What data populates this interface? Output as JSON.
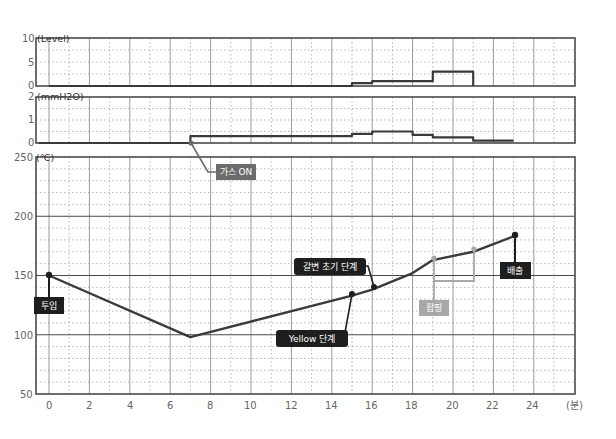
{
  "chart_data": [
    {
      "id": "level",
      "type": "line",
      "step": true,
      "title": "",
      "ylabel": "(Level)",
      "ylim": [
        0,
        10
      ],
      "yticks": [
        0,
        5,
        10
      ],
      "x": [
        0,
        15,
        15,
        16,
        16,
        19,
        19,
        21,
        21
      ],
      "values": [
        0,
        0,
        0.6,
        0.6,
        1.0,
        1.0,
        3.0,
        3.0,
        0
      ],
      "grid": true
    },
    {
      "id": "pressure",
      "type": "line",
      "step": true,
      "ylabel": "(mmH2O)",
      "ylim": [
        0,
        2
      ],
      "yticks": [
        0,
        1,
        2
      ],
      "x": [
        -0.5,
        7,
        7,
        15,
        15,
        16,
        16,
        18,
        18,
        19,
        19,
        21,
        21,
        23
      ],
      "values": [
        0,
        0,
        0.3,
        0.3,
        0.4,
        0.4,
        0.5,
        0.5,
        0.35,
        0.35,
        0.25,
        0.25,
        0.1,
        0.1
      ],
      "grid": true
    },
    {
      "id": "temperature",
      "type": "line",
      "ylabel": "(℃)",
      "xlabel": "(분)",
      "ylim": [
        50,
        250
      ],
      "yticks": [
        50,
        100,
        150,
        200,
        250
      ],
      "xlim": [
        -0.6,
        26
      ],
      "xticks": [
        0,
        2,
        4,
        6,
        8,
        10,
        12,
        14,
        16,
        18,
        20,
        22,
        24
      ],
      "x": [
        0,
        7,
        15,
        16,
        18,
        19,
        21,
        23
      ],
      "values": [
        150,
        98,
        133,
        138,
        152,
        163,
        170,
        183
      ],
      "grid": true,
      "annotations": [
        {
          "text": "투입",
          "x": 0,
          "y": 150,
          "style": "dark"
        },
        {
          "text": "가스 ON",
          "x": 7,
          "y": 0,
          "panel": "pressure",
          "style": "gray"
        },
        {
          "text": "Yellow 단계",
          "x": 15,
          "y": 133,
          "style": "dark"
        },
        {
          "text": "갈변 초기 단계",
          "x": 16,
          "y": 138,
          "style": "dark"
        },
        {
          "text": "팝핑",
          "x": 19,
          "y": 163,
          "x2": 21,
          "y2": 170,
          "style": "light-gray"
        },
        {
          "text": "배출",
          "x": 23,
          "y": 183,
          "style": "dark"
        }
      ]
    }
  ],
  "labels": {
    "level_unit": "(Level)",
    "pressure_unit": "(mmH2O)",
    "temp_unit": "(℃)",
    "x_unit": "(분)",
    "level_ticks": [
      "10",
      "5",
      "0"
    ],
    "pressure_ticks": [
      "2",
      "1",
      "0"
    ],
    "temp_ticks": [
      "250",
      "200",
      "150",
      "100",
      "50"
    ],
    "x_ticks": [
      "0",
      "2",
      "4",
      "6",
      "8",
      "10",
      "12",
      "14",
      "16",
      "18",
      "20",
      "22",
      "24"
    ],
    "ann_input": "투입",
    "ann_gas_on": "가스 ON",
    "ann_yellow": "Yellow 단계",
    "ann_browning": "갈변 초기 단계",
    "ann_popping": "팝핑",
    "ann_discharge": "배출"
  },
  "colors": {
    "line": "#3a3a3a",
    "frame": "#4a4a4a",
    "grid_major": "#9a9a9a",
    "grid_minor": "#b5b5b5",
    "label_dark": "#1e1e1e",
    "label_gray": "#6b6b6b",
    "label_light": "#a8a8a8",
    "popping_line": "#a8a8a8"
  }
}
